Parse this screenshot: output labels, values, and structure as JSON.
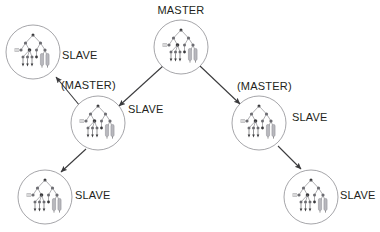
{
  "diagram": {
    "type": "node-link-diagram",
    "canvas": {
      "width": 380,
      "height": 232
    },
    "colors": {
      "background": "#ffffff",
      "text": "#231f20",
      "circle_stroke": "#8e8e93",
      "arrow": "#3a3a3c",
      "glyph_light": "#6d6d72",
      "glyph_dark": "#3a3a3c",
      "glyph_bar": "#b8b8bd"
    },
    "label_text": {
      "master": "MASTER",
      "slave": "SLAVE",
      "master_parenthesized": "(MASTER)"
    },
    "nodes": [
      {
        "id": "root-master",
        "role": "MASTER",
        "label": "MASTER",
        "label_position": "above",
        "cx": 181,
        "cy": 47,
        "r": 27,
        "glyph": "tree-graph-icon"
      },
      {
        "id": "slave-top-left",
        "role": "SLAVE",
        "label": "SLAVE",
        "label_position": "right",
        "cx": 33,
        "cy": 52,
        "r": 27,
        "glyph": "tree-graph-icon"
      },
      {
        "id": "mid-left",
        "role": "SLAVE",
        "label": "SLAVE",
        "label_position": "right",
        "secondary_label": "(MASTER)",
        "secondary_label_position": "above-left",
        "cx": 98,
        "cy": 123,
        "r": 27,
        "glyph": "tree-graph-icon"
      },
      {
        "id": "mid-right",
        "role": "SLAVE",
        "label": "SLAVE",
        "label_position": "right",
        "secondary_label": "(MASTER)",
        "secondary_label_position": "above-left",
        "cx": 259,
        "cy": 123,
        "r": 27,
        "glyph": "tree-graph-icon"
      },
      {
        "id": "slave-bottom-left",
        "role": "SLAVE",
        "label": "SLAVE",
        "label_position": "right",
        "cx": 45,
        "cy": 197,
        "r": 27,
        "glyph": "tree-graph-icon"
      },
      {
        "id": "slave-bottom-right",
        "role": "SLAVE",
        "label": "SLAVE",
        "label_position": "right",
        "cx": 311,
        "cy": 197,
        "r": 27,
        "glyph": "tree-graph-icon"
      }
    ],
    "edges": [
      {
        "id": "edge-root-to-midleft",
        "from": "root-master",
        "to": "mid-left",
        "arrow": "end"
      },
      {
        "id": "edge-root-to-midright",
        "from": "root-master",
        "to": "mid-right",
        "arrow": "end"
      },
      {
        "id": "edge-midleft-to-topleft",
        "from": "mid-left",
        "to": "slave-top-left",
        "arrow": "end"
      },
      {
        "id": "edge-midleft-to-botleft",
        "from": "mid-left",
        "to": "slave-bottom-left",
        "arrow": "end"
      },
      {
        "id": "edge-midright-to-botright",
        "from": "mid-right",
        "to": "slave-bottom-right",
        "arrow": "end"
      }
    ],
    "labels": [
      {
        "id": "label-master-root",
        "text": "MASTER",
        "x": 181,
        "y": 11,
        "anchor": "middle"
      },
      {
        "id": "label-slave-top-left",
        "text": "SLAVE",
        "x": 62,
        "y": 56,
        "anchor": "start"
      },
      {
        "id": "label-master-paren-left",
        "text": "(MASTER)",
        "x": 61,
        "y": 86,
        "anchor": "start"
      },
      {
        "id": "label-slave-mid-left",
        "text": "SLAVE",
        "x": 128,
        "y": 110,
        "anchor": "start"
      },
      {
        "id": "label-master-paren-right",
        "text": "(MASTER)",
        "x": 237,
        "y": 87,
        "anchor": "start"
      },
      {
        "id": "label-slave-mid-right",
        "text": "SLAVE",
        "x": 292,
        "y": 118,
        "anchor": "start"
      },
      {
        "id": "label-slave-bottom-left",
        "text": "SLAVE",
        "x": 75,
        "y": 196,
        "anchor": "start"
      },
      {
        "id": "label-slave-bottom-right",
        "text": "SLAVE",
        "x": 340,
        "y": 196,
        "anchor": "start"
      }
    ]
  }
}
